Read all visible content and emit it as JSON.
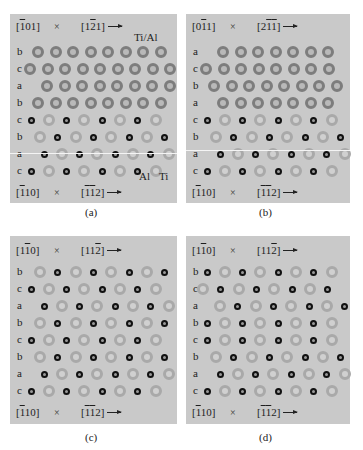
{
  "figure": {
    "panels": [
      {
        "id": "a",
        "caption": "(a)",
        "header": {
          "zone_axis": "[̅0 1]",
          "zone_html": "[<span class='ov'>1</span>01]",
          "times": "×",
          "direction_html": "[1<span class='ov'>2</span>1]"
        },
        "footer": {
          "zone_html": "[<span class='ov'>1</span>10]",
          "times": "×",
          "direction_html": "[<span class='ov'>1</span><span class='ov'>1</span>2]"
        },
        "top_legend": "Ti/Al",
        "bottom_legend": [
          "Al",
          "Ti"
        ],
        "rows": [
          {
            "label": "b",
            "start": 28,
            "pattern": "tial",
            "count": 9
          },
          {
            "label": "c",
            "start": 20,
            "pattern": "tial",
            "count": 9
          },
          {
            "label": "a",
            "start": 37,
            "pattern": "tial",
            "count": 9
          },
          {
            "label": "b",
            "start": 28,
            "pattern": "tial",
            "count": 9
          },
          {
            "label": "c",
            "start": 21,
            "pattern": "al,ti",
            "count": 8
          },
          {
            "label": "b",
            "start": 30,
            "pattern": "ti,al",
            "count": 8
          },
          {
            "label": "a",
            "start": 34,
            "pattern": "al,ti",
            "count": 8
          },
          {
            "label": "c",
            "start": 21,
            "pattern": "al,ti",
            "count": 8
          }
        ]
      },
      {
        "id": "b",
        "caption": "(b)",
        "header": {
          "zone_html": "[0<span class='ov'>1</span>1]",
          "times": "×",
          "direction_html": "[2<span class='ov'>1</span><span class='ov'>1</span>]"
        },
        "footer": {
          "zone_html": "[<span class='ov'>1</span>10]",
          "times": "×",
          "direction_html": "[<span class='ov'>1</span><span class='ov'>1</span>2]"
        },
        "rows": [
          {
            "label": "a",
            "start": 37,
            "pattern": "tial",
            "count": 8
          },
          {
            "label": "c",
            "start": 20,
            "pattern": "tial",
            "count": 8
          },
          {
            "label": "b",
            "start": 28,
            "pattern": "tial",
            "count": 8
          },
          {
            "label": "a",
            "start": 37,
            "pattern": "tial",
            "count": 8
          },
          {
            "label": "c",
            "start": 21,
            "pattern": "al,ti",
            "count": 8
          },
          {
            "label": "b",
            "start": 30,
            "pattern": "ti,al",
            "count": 8
          },
          {
            "label": "a",
            "start": 34,
            "pattern": "al,ti",
            "count": 8
          },
          {
            "label": "c",
            "start": 21,
            "pattern": "al,ti",
            "count": 8
          }
        ]
      },
      {
        "id": "c",
        "caption": "(c)",
        "header": {
          "zone_html": "[1<span class='ov'>1</span>0]",
          "times": "×",
          "direction_html": "[11<span class='ov'>2</span>]"
        },
        "footer": {
          "zone_html": "[<span class='ov'>1</span>10]",
          "times": "×",
          "direction_html": "[<span class='ov'>1</span><span class='ov'>1</span>2]"
        },
        "rows": [
          {
            "label": "b",
            "start": 30,
            "pattern": "ti,al",
            "count": 8
          },
          {
            "label": "c",
            "start": 21,
            "pattern": "al,ti",
            "count": 8
          },
          {
            "label": "a",
            "start": 34,
            "pattern": "al,ti",
            "count": 8
          },
          {
            "label": "b",
            "start": 30,
            "pattern": "ti,al",
            "count": 8
          },
          {
            "label": "c",
            "start": 21,
            "pattern": "al,ti",
            "count": 8
          },
          {
            "label": "b",
            "start": 30,
            "pattern": "ti,al",
            "count": 8
          },
          {
            "label": "a",
            "start": 34,
            "pattern": "al,ti",
            "count": 8
          },
          {
            "label": "c",
            "start": 21,
            "pattern": "al,ti",
            "count": 8
          }
        ]
      },
      {
        "id": "d",
        "caption": "(d)",
        "header": {
          "zone_html": "[1<span class='ov'>1</span>0]",
          "times": "×",
          "direction_html": "[11<span class='ov'>2</span>]"
        },
        "footer": {
          "zone_html": "[<span class='ov'>1</span>10]",
          "times": "×",
          "direction_html": "[<span class='ov'>1</span><span class='ov'>1</span>2]"
        },
        "rows": [
          {
            "label": "b",
            "start": 21,
            "pattern": "al,ti",
            "count": 8
          },
          {
            "label": "c",
            "start": 17,
            "pattern": "ti,al",
            "count": 8
          },
          {
            "label": "a",
            "start": 34,
            "pattern": "ti,al",
            "count": 8
          },
          {
            "label": "b",
            "start": 21,
            "pattern": "al,ti",
            "count": 8
          },
          {
            "label": "c",
            "start": 21,
            "pattern": "al,ti",
            "count": 8
          },
          {
            "label": "b",
            "start": 30,
            "pattern": "ti,al",
            "count": 8
          },
          {
            "label": "a",
            "start": 34,
            "pattern": "al,ti",
            "count": 8
          },
          {
            "label": "c",
            "start": 21,
            "pattern": "al,ti",
            "count": 8
          }
        ]
      }
    ],
    "atom_colors": {
      "tial_ring": "#7d7d7d",
      "ti_ring": "#a9a9a9",
      "al_ring": "#111111",
      "panel_bg": "#c9c9c9"
    }
  }
}
